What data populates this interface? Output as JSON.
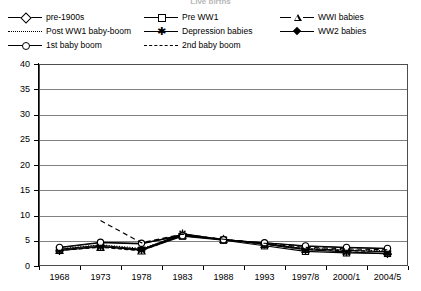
{
  "title": "Live births",
  "legend": {
    "position": "top",
    "entries": [
      {
        "label": "pre-1900s",
        "style": "solid",
        "marker": "diamond-open",
        "col": 0,
        "row": 0
      },
      {
        "label": "Pre WW1",
        "style": "solid",
        "marker": "square-open",
        "col": 1,
        "row": 0
      },
      {
        "label": "WWI babies",
        "style": "dashed",
        "marker": "triangle-open",
        "col": 2,
        "row": 0
      },
      {
        "label": "Post WW1 baby-boom",
        "style": "dotted",
        "marker": "none",
        "col": 0,
        "row": 1
      },
      {
        "label": "Depression babies",
        "style": "solid",
        "marker": "star",
        "col": 1,
        "row": 1
      },
      {
        "label": "WW2 babies",
        "style": "solid",
        "marker": "diamond-filled",
        "col": 2,
        "row": 1
      },
      {
        "label": "1st baby boom",
        "style": "solid",
        "marker": "circle-open",
        "col": 0,
        "row": 2
      },
      {
        "label": "2nd baby boom",
        "style": "dashed",
        "marker": "none",
        "col": 1,
        "row": 2
      }
    ]
  },
  "chart_data": {
    "type": "line",
    "title": "Live births",
    "xlabel": "",
    "ylabel": "",
    "grid": true,
    "legend_position": "top",
    "categories": [
      "1968",
      "1973",
      "1978",
      "1983",
      "1988",
      "1993",
      "1997/8",
      "2000/1",
      "2004/5"
    ],
    "ylim": [
      0,
      40
    ],
    "yticks": [
      0,
      5,
      10,
      15,
      20,
      25,
      30,
      35,
      40
    ],
    "series": [
      {
        "name": "pre-1900s",
        "values": [
          3.6,
          4.6,
          4.4,
          6.2,
          5.2,
          4.6,
          3.9,
          3.6,
          3.4
        ]
      },
      {
        "name": "Pre WW1",
        "values": [
          3.2,
          3.9,
          3.1,
          5.9,
          5.1,
          4.0,
          2.9,
          2.6,
          2.5
        ]
      },
      {
        "name": "WWI babies",
        "values": [
          3.1,
          3.7,
          3.0,
          6.1,
          5.3,
          4.3,
          3.3,
          3.0,
          2.9
        ]
      },
      {
        "name": "Post WW1 baby-boom",
        "values": [
          3.4,
          4.2,
          3.5,
          6.0,
          5.3,
          4.4,
          3.5,
          3.2,
          3.0
        ]
      },
      {
        "name": "Depression babies",
        "values": [
          3.0,
          3.8,
          3.2,
          6.4,
          5.2,
          4.3,
          3.2,
          2.8,
          2.4
        ]
      },
      {
        "name": "WW2 babies",
        "values": [
          3.3,
          4.1,
          3.3,
          6.1,
          5.2,
          4.4,
          3.4,
          3.1,
          2.8
        ]
      },
      {
        "name": "1st baby boom",
        "values": [
          3.7,
          4.7,
          4.5,
          6.0,
          5.2,
          4.6,
          4.0,
          3.7,
          3.5
        ]
      },
      {
        "name": "2nd baby boom",
        "values": [
          null,
          9.0,
          4.6,
          6.3,
          5.3,
          4.5,
          3.7,
          3.4,
          3.2
        ]
      }
    ]
  }
}
